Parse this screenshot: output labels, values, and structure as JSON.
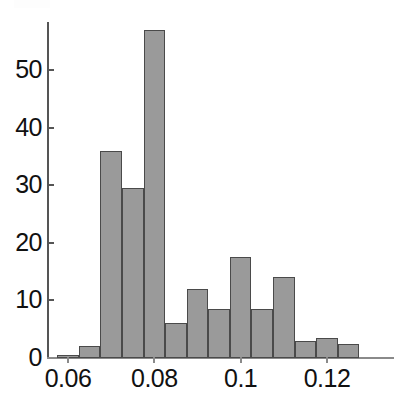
{
  "chart_data": {
    "type": "bar",
    "subtype": "histogram",
    "title": "",
    "subtitle": "",
    "xlabel": "",
    "ylabel": "",
    "xlim": [
      0.0555,
      0.129
    ],
    "ylim": [
      0,
      58
    ],
    "grid": false,
    "legend": null,
    "legend_position": "none",
    "bar_fill_color": "#9a9a9a",
    "bar_edge_color": "#4a4a4a",
    "axis_color": "#555555",
    "bin_width": 0.005,
    "bin_edges": [
      0.0575,
      0.0625,
      0.0675,
      0.0725,
      0.0775,
      0.0825,
      0.0875,
      0.0925,
      0.0975,
      0.1025,
      0.1075,
      0.1125,
      0.1175,
      0.1225,
      0.1275
    ],
    "bin_centers": [
      0.06,
      0.065,
      0.07,
      0.075,
      0.08,
      0.085,
      0.09,
      0.095,
      0.1,
      0.105,
      0.11,
      0.115,
      0.12,
      0.125
    ],
    "categories": [
      "0.0575-0.0625",
      "0.0625-0.0675",
      "0.0675-0.0725",
      "0.0725-0.0775",
      "0.0775-0.0825",
      "0.0825-0.0875",
      "0.0875-0.0925",
      "0.0925-0.0975",
      "0.0975-0.1025",
      "0.1025-0.1075",
      "0.1075-0.1125",
      "0.1125-0.1175",
      "0.1175-0.1225",
      "0.1225-0.1275"
    ],
    "values": [
      0.5,
      2,
      36,
      29.5,
      57,
      6,
      12,
      8.5,
      17.5,
      8.5,
      14,
      3,
      3.5,
      2.5
    ],
    "xticks": [
      0.06,
      0.08,
      0.1,
      0.12
    ],
    "xticklabels": [
      "0.06",
      "0.08",
      "0.1",
      "0.12"
    ],
    "yticks": [
      0,
      10,
      20,
      30,
      40,
      50
    ],
    "yticklabels": [
      "0",
      "10",
      "20",
      "30",
      "40",
      "50"
    ]
  },
  "axes": {
    "y_labels": [
      "50",
      "40",
      "30",
      "20",
      "10",
      "0"
    ],
    "x_labels": [
      "0.06",
      "0.08",
      "0.1",
      "0.12"
    ]
  }
}
